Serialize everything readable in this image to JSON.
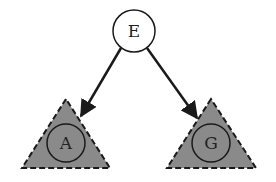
{
  "diagram": {
    "type": "binary-tree",
    "colors": {
      "subtree_fill": "#8a8a8a",
      "stroke": "#1a1a1a",
      "root_fill": "#ffffff"
    },
    "root": {
      "label": "E",
      "cx": 134,
      "cy": 31,
      "r": 21
    },
    "children": [
      {
        "label": "A",
        "cx": 66,
        "cy": 143,
        "r": 19,
        "triangle": {
          "apex": [
            66,
            99
          ],
          "base_left": [
            22,
            168
          ],
          "base_right": [
            110,
            168
          ]
        }
      },
      {
        "label": "G",
        "cx": 211,
        "cy": 143,
        "r": 19,
        "triangle": {
          "apex": [
            211,
            99
          ],
          "base_left": [
            167,
            168
          ],
          "base_right": [
            256,
            168
          ]
        }
      }
    ]
  }
}
